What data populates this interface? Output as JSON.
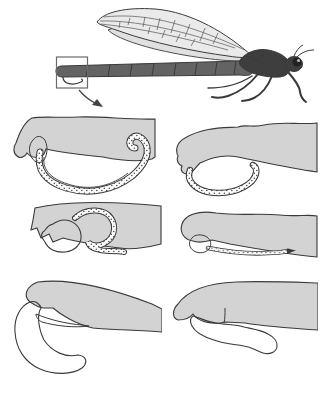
{
  "colors": {
    "background": "#ffffff",
    "outline": "#3a3a3a",
    "segment_gray": "#d3d3d3",
    "insect_body": "#636363",
    "insect_dark": "#3e3e3e",
    "wing_fill": "#eaeaea",
    "hindwing_fill": "#e0e0e0",
    "vein_color": "#555555",
    "stipple_dot": "#444444",
    "box_stroke": "#6b6b6b",
    "arrow_color": "#444444"
  },
  "overview": {
    "label": "damselfly side view illustration",
    "inset_label": "abdomen tip inset box",
    "arrow_label": "leader arrow pointing to clasper details"
  },
  "details": [
    {
      "label": "clasper detail top-left: long sweeping curved cercus"
    },
    {
      "label": "clasper detail top-right: open oval looped cercus"
    },
    {
      "label": "clasper detail middle-left: bulbous cercus with hooked loop"
    },
    {
      "label": "clasper detail middle-right: thin straight cercus"
    },
    {
      "label": "clasper detail bottom-left: thick down-curved cercus with spine"
    },
    {
      "label": "clasper detail bottom-right: lumpy elongated cercus"
    }
  ]
}
